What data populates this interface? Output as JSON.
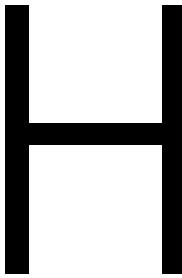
{
  "glyph": {
    "character": "H",
    "color": "#000000",
    "background": "#ffffff"
  }
}
